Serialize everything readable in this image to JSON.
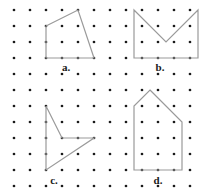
{
  "canvas": {
    "width": 211,
    "height": 196,
    "background_color": "#ffffff"
  },
  "grid": {
    "name": "dot-lattice",
    "dot_color": "#1a1a1a",
    "dot_radius": 1.35,
    "spacing": 16,
    "origin_x": 14,
    "origin_y": 10,
    "columns": 12,
    "rows": 12
  },
  "figures": [
    {
      "id": "a",
      "label": "a.",
      "label_x": 66,
      "label_y": 67,
      "shape": "quadrilateral",
      "stroke_color": "#9a9a9a",
      "stroke_width": 1.2,
      "closed": true,
      "points": "46,26 78,10 94,58 46,58"
    },
    {
      "id": "b",
      "label": "b.",
      "label_x": 160,
      "label_y": 67,
      "shape": "envelope-pentagon",
      "stroke_color": "#9a9a9a",
      "stroke_width": 1.2,
      "closed": true,
      "points": "134,10 166,42 198,10 198,58 134,58"
    },
    {
      "id": "c",
      "label": "c.",
      "label_x": 54,
      "label_y": 180,
      "shape": "dart-quadrilateral",
      "stroke_color": "#9a9a9a",
      "stroke_width": 1.2,
      "closed": true,
      "points": "46,106 62,138 94,138 46,170"
    },
    {
      "id": "d",
      "label": "d.",
      "label_x": 158,
      "label_y": 180,
      "shape": "house-pentagon",
      "stroke_color": "#9a9a9a",
      "stroke_width": 1.2,
      "closed": true,
      "points": "150,90 182,122 182,170 134,170 134,106"
    }
  ]
}
